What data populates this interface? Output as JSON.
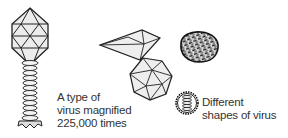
{
  "figure": {
    "illustrations": [
      {
        "name": "bacteriophage",
        "description": "Icosahedral head with coiled tail and base plate"
      },
      {
        "name": "diamond-virus",
        "description": "Elongated bipyramidal virus"
      },
      {
        "name": "icosahedral-virus",
        "description": "Polyhedral icosahedral virus"
      },
      {
        "name": "textured-virus",
        "description": "Rounded virus with dense textured surface"
      },
      {
        "name": "coiled-virus",
        "description": "Small round virus with stacked coil interior"
      }
    ],
    "caption_left": {
      "line1": "A type of",
      "line2": "virus magnified",
      "line3": "225,000 times"
    },
    "caption_right": {
      "line1": "Different",
      "line2": "shapes of virus"
    }
  }
}
